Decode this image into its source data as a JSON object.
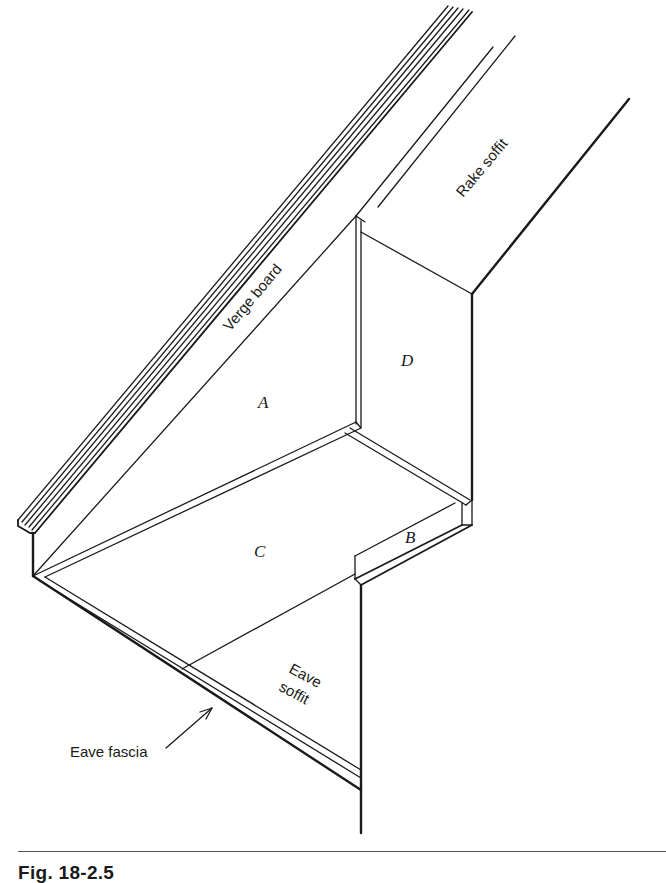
{
  "figure": {
    "caption": "Fig. 18-2.5",
    "labels": {
      "verge_board": "Verge board",
      "rake_soffit": "Rake soffit",
      "eave_soffit_line1": "Eave",
      "eave_soffit_line2": "soffit",
      "eave_fascia": "Eave fascia",
      "panel_a": "A",
      "panel_b": "B",
      "panel_c": "C",
      "panel_d": "D"
    },
    "colors": {
      "line": "#1a1a1a",
      "background": "#ffffff"
    }
  }
}
